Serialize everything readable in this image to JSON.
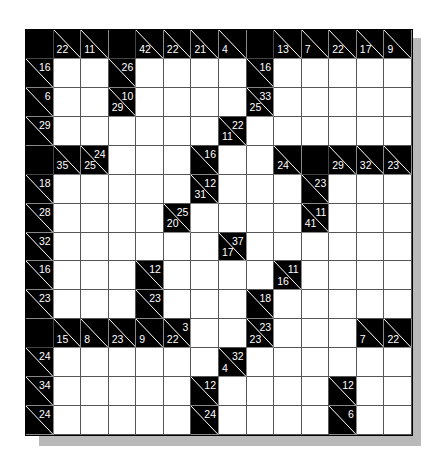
{
  "puzzle": {
    "type": "kakuro",
    "rows": 14,
    "cols": 14,
    "colors": {
      "block": "#000000",
      "blank": "#ffffff",
      "shadow": "#b9b9b9",
      "clue_text": "#ffffff"
    },
    "legend": "Each cell: 'B' = black block, 'W' = empty white entry cell, object = clue cell with down (bottom-left) and/or right (top-right) sum",
    "grid": [
      [
        "B",
        {
          "d": 22
        },
        {
          "d": 11
        },
        "B",
        {
          "d": 42
        },
        {
          "d": 22
        },
        {
          "d": 21
        },
        {
          "d": 4
        },
        "B",
        {
          "d": 13
        },
        {
          "d": 7
        },
        {
          "d": 22
        },
        {
          "d": 17
        },
        {
          "d": 9
        }
      ],
      [
        {
          "r": 16
        },
        "W",
        "W",
        {
          "r": 26
        },
        "W",
        "W",
        "W",
        "W",
        {
          "r": 16
        },
        "W",
        "W",
        "W",
        "W",
        "W"
      ],
      [
        {
          "r": 6
        },
        "W",
        "W",
        {
          "d": 29,
          "r": 10
        },
        "W",
        "W",
        "W",
        "W",
        {
          "d": 25,
          "r": 33
        },
        "W",
        "W",
        "W",
        "W",
        "W"
      ],
      [
        {
          "r": 29
        },
        "W",
        "W",
        "W",
        "W",
        "W",
        "W",
        {
          "d": 11,
          "r": 22
        },
        "W",
        "W",
        "W",
        "W",
        "W",
        "W"
      ],
      [
        "B",
        {
          "d": 35
        },
        {
          "d": 25,
          "r": 24
        },
        "W",
        "W",
        "W",
        {
          "r": 16
        },
        "W",
        "W",
        {
          "d": 24
        },
        "B",
        {
          "d": 29
        },
        {
          "d": 32
        },
        {
          "d": 23
        }
      ],
      [
        {
          "r": 18
        },
        "W",
        "W",
        "W",
        "W",
        "W",
        {
          "d": 31,
          "r": 12
        },
        "W",
        "W",
        "W",
        {
          "r": 23
        },
        "W",
        "W",
        "W"
      ],
      [
        {
          "r": 28
        },
        "W",
        "W",
        "W",
        "W",
        {
          "d": 20,
          "r": 25
        },
        "W",
        "W",
        "W",
        "W",
        {
          "d": 41,
          "r": 11
        },
        "W",
        "W",
        "W"
      ],
      [
        {
          "r": 32
        },
        "W",
        "W",
        "W",
        "W",
        "W",
        "W",
        {
          "d": 17,
          "r": 37
        },
        "W",
        "W",
        "W",
        "W",
        "W",
        "W"
      ],
      [
        {
          "r": 16
        },
        "W",
        "W",
        "W",
        {
          "r": 12
        },
        "W",
        "W",
        "W",
        "W",
        {
          "d": 16,
          "r": 11
        },
        "W",
        "W",
        "W",
        "W"
      ],
      [
        {
          "r": 23
        },
        "W",
        "W",
        "W",
        {
          "r": 23
        },
        "W",
        "W",
        "W",
        {
          "r": 18
        },
        "W",
        "W",
        "W",
        "W",
        "W"
      ],
      [
        "B",
        {
          "d": 15
        },
        {
          "d": 8
        },
        {
          "d": 23
        },
        {
          "d": 9
        },
        {
          "d": 22,
          "r": 3
        },
        "W",
        "W",
        {
          "d": 23,
          "r": 23
        },
        "W",
        "W",
        "W",
        {
          "d": 7
        },
        {
          "d": 22
        }
      ],
      [
        {
          "r": 24
        },
        "W",
        "W",
        "W",
        "W",
        "W",
        "W",
        {
          "d": 4,
          "r": 32
        },
        "W",
        "W",
        "W",
        "W",
        "W",
        "W"
      ],
      [
        {
          "r": 34
        },
        "W",
        "W",
        "W",
        "W",
        "W",
        {
          "r": 12
        },
        "W",
        "W",
        "W",
        "W",
        {
          "r": 12
        },
        "W",
        "W"
      ],
      [
        {
          "r": 24
        },
        "W",
        "W",
        "W",
        "W",
        "W",
        {
          "r": 24
        },
        "W",
        "W",
        "W",
        "W",
        {
          "r": 6
        },
        "W",
        "W"
      ]
    ]
  }
}
